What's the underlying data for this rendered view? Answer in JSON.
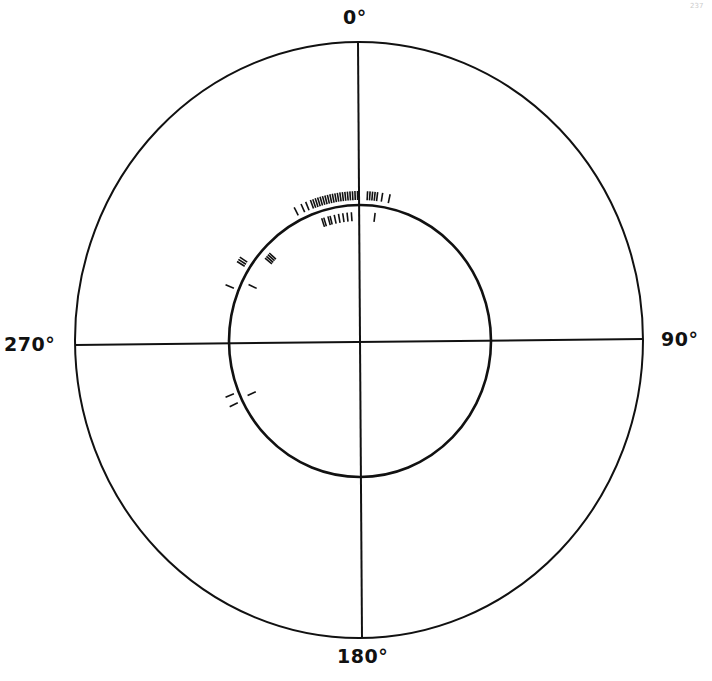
{
  "diagram": {
    "type": "polar-orientation-plot",
    "labels": {
      "top": "0°",
      "right": "90°",
      "bottom": "180°",
      "left": "270°"
    },
    "page_number": "237",
    "colors": {
      "line": "#111111",
      "background": "#ffffff"
    }
  },
  "chart_data": {
    "type": "scatter",
    "title": "",
    "projection": "polar",
    "axis_labels": [
      "0°",
      "90°",
      "180°",
      "270°"
    ],
    "circles": [
      {
        "name": "outer",
        "cx": 359,
        "cy": 340,
        "rx": 284,
        "ry": 298
      },
      {
        "name": "inner",
        "cx": 360,
        "cy": 341,
        "rx": 131,
        "ry": 136
      }
    ],
    "outer_ticks_deg": [
      333,
      336,
      338,
      340,
      341,
      342,
      343,
      344,
      345,
      346,
      347,
      348,
      349,
      350,
      351,
      352,
      353,
      354,
      355,
      356,
      357,
      358,
      359,
      3,
      4,
      5,
      6,
      7,
      9,
      12,
      302,
      303,
      304,
      292,
      248,
      244
    ],
    "inner_ticks_deg": [
      342,
      343,
      345,
      346,
      348,
      350,
      352,
      354,
      356,
      7,
      310,
      311,
      312,
      313,
      296,
      245
    ]
  }
}
